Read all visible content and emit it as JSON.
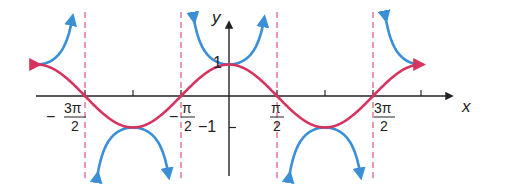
{
  "chart_data": {
    "type": "line",
    "title": "",
    "xlabel": "x",
    "ylabel": "y",
    "xlim": [
      -6.6,
      6.9
    ],
    "ylim": [
      -2.5,
      2.5
    ],
    "grid": false,
    "x_ticks": [
      {
        "value": -4.712,
        "label_num": "3π",
        "label_den": "2",
        "sign": "−"
      },
      {
        "value": -3.1416,
        "label_num": "",
        "label_den": "",
        "sign": ""
      },
      {
        "value": -1.5708,
        "label_num": "π",
        "label_den": "2",
        "sign": "−"
      },
      {
        "value": 1.5708,
        "label_num": "π",
        "label_den": "2",
        "sign": ""
      },
      {
        "value": 3.1416,
        "label_num": "",
        "label_den": "",
        "sign": ""
      },
      {
        "value": 4.712,
        "label_num": "3π",
        "label_den": "2",
        "sign": ""
      },
      {
        "value": 6.2832,
        "label_num": "",
        "label_den": "",
        "sign": ""
      }
    ],
    "y_ticks": [
      {
        "value": 1,
        "label": "1"
      },
      {
        "value": -1,
        "label": "−1"
      }
    ],
    "series": [
      {
        "name": "y = cos x",
        "color": "#d6335e",
        "domain": [
          -6.2832,
          6.2832
        ],
        "function": "cos"
      },
      {
        "name": "y = sec x",
        "color": "#3a8fd6",
        "domain": [
          -6.2832,
          6.2832
        ],
        "function": "sec"
      }
    ],
    "asymptotes": {
      "color": "#d6335e",
      "style": "dashed",
      "x": [
        -4.712,
        -1.5708,
        1.5708,
        4.712
      ]
    }
  },
  "labels": {
    "x_axis": "x",
    "y_axis": "y",
    "y_one": "1",
    "y_neg_one": "−1",
    "neg_three_pi_num": "3π",
    "neg_three_pi_den": "2",
    "neg_sign": "−",
    "neg_pi_num": "π",
    "neg_pi_den": "2",
    "pi_num": "π",
    "pi_den": "2",
    "three_pi_num": "3π",
    "three_pi_den": "2"
  },
  "colors": {
    "cos": "#d6335e",
    "sec": "#3a8fd6",
    "axis": "#222222",
    "asymptote": "#d6335e"
  }
}
